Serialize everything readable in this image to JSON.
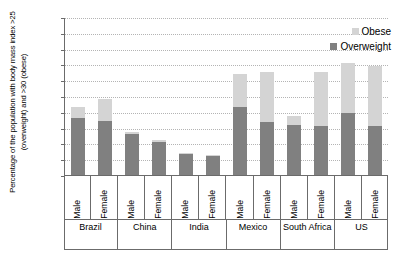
{
  "chart_data": {
    "type": "bar",
    "subtype": "stacked",
    "title": "",
    "xlabel": "",
    "ylabel": "Percentage of the population with body mass index >25 (overweight) and >30 (obese)",
    "ylim": [
      0,
      100
    ],
    "ytick_step": 10,
    "yticks": [
      "0",
      "10",
      "20",
      "30",
      "40",
      "50",
      "60",
      "70",
      "80",
      "90",
      "100"
    ],
    "grid": true,
    "legend_position": "top-right",
    "legend": [
      "Obese",
      "Overweight"
    ],
    "colors": {
      "obese": "#d4d4d4",
      "overweight": "#808080",
      "axis": "#6b6b6b",
      "gridline": "#b4b4b4",
      "background": "#ffffff"
    },
    "groups": [
      "Brazil",
      "China",
      "India",
      "Mexico",
      "South Africa",
      "US"
    ],
    "subcategories": [
      "Male",
      "Female"
    ],
    "categories": [
      "Brazil Male",
      "Brazil Female",
      "China Male",
      "China Female",
      "India Male",
      "India Female",
      "Mexico Male",
      "Mexico Female",
      "South Africa Male",
      "South Africa Female",
      "US Male",
      "US Female"
    ],
    "series": [
      {
        "name": "Overweight",
        "color": "#808080",
        "values": [
          36,
          34,
          26,
          21,
          13,
          12,
          43,
          33.5,
          31.5,
          31,
          39,
          31
        ]
      },
      {
        "name": "Obese",
        "color": "#d4d4d4",
        "values": [
          7,
          14,
          1,
          1,
          1,
          0.5,
          21,
          31.5,
          6,
          34,
          32,
          38
        ]
      }
    ],
    "totals": [
      43,
      48,
      27,
      22,
      14,
      12.5,
      64,
      65,
      37.5,
      65,
      71,
      69
    ],
    "bars": [
      {
        "group": "Brazil",
        "sex": "Male",
        "overweight": 36,
        "obese": 7,
        "total": 43
      },
      {
        "group": "Brazil",
        "sex": "Female",
        "overweight": 34,
        "obese": 14,
        "total": 48
      },
      {
        "group": "China",
        "sex": "Male",
        "overweight": 26,
        "obese": 1,
        "total": 27
      },
      {
        "group": "China",
        "sex": "Female",
        "overweight": 21,
        "obese": 1,
        "total": 22
      },
      {
        "group": "India",
        "sex": "Male",
        "overweight": 13,
        "obese": 1,
        "total": 14
      },
      {
        "group": "India",
        "sex": "Female",
        "overweight": 12,
        "obese": 0.5,
        "total": 12.5
      },
      {
        "group": "Mexico",
        "sex": "Male",
        "overweight": 43,
        "obese": 21,
        "total": 64
      },
      {
        "group": "Mexico",
        "sex": "Female",
        "overweight": 33.5,
        "obese": 31.5,
        "total": 65
      },
      {
        "group": "South Africa",
        "sex": "Male",
        "overweight": 31.5,
        "obese": 6,
        "total": 37.5
      },
      {
        "group": "South Africa",
        "sex": "Female",
        "overweight": 31,
        "obese": 34,
        "total": 65
      },
      {
        "group": "US",
        "sex": "Male",
        "overweight": 39,
        "obese": 32,
        "total": 71
      },
      {
        "group": "US",
        "sex": "Female",
        "overweight": 31,
        "obese": 38,
        "total": 69
      }
    ]
  }
}
